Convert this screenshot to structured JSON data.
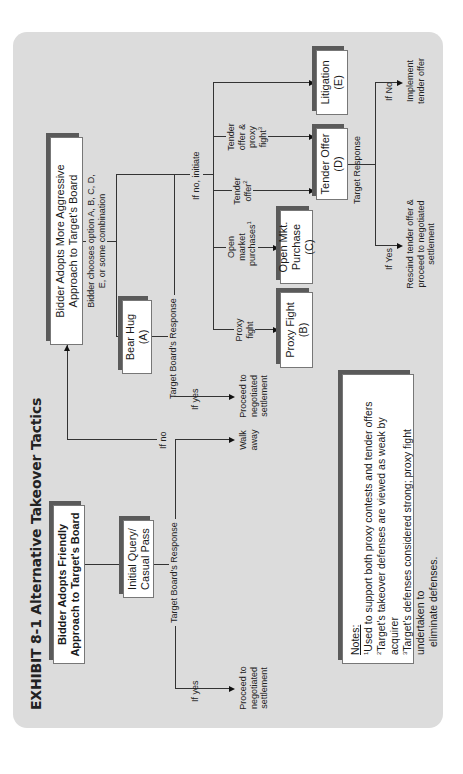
{
  "title": "EXHIBIT 8-1   Alternative Takeover Tactics",
  "boxes": {
    "friendly": "Bidder Adopts Friendly Approach to Target's Board",
    "initial_query": "Initial Query/ Casual Pass",
    "aggressive": "Bidder Adopts More Aggressive Approach to Target's Board",
    "bear_hug": "Bear Hug (A)",
    "proxy_fight": "Proxy Fight (B)",
    "open_market": "Open Mkt. Purchase  (C)",
    "tender_offer": "Tender Offer (D)",
    "litigation": "Litigation (E)"
  },
  "labels": {
    "target_boards_response_1": "Target Board's Response",
    "if_yes_1": "If yes",
    "proceed_1": "Proceed to negotiated settlement",
    "if_no_1": "If no",
    "walk_away": "Walk away",
    "bidder_chooses": "Bidder chooses option A, B, C, D, E, or some combination",
    "target_boards_response_2": "Target Board's Response",
    "if_yes_2": "If yes",
    "proceed_2": "Proceed to negotiated settlement",
    "if_no_initiate": "If no, initiate",
    "proxy_fight_branch": "Proxy fight",
    "open_market_branch": "Open market purchases",
    "open_market_sup": "1",
    "tender_offer_branch": "Tender offer",
    "tender_offer_sup": "2",
    "tender_proxy_branch": "Tender offer & proxy fight",
    "tender_proxy_sup": "3",
    "target_response": "Target Response",
    "if_yes_3": "If Yes",
    "rescind": "Rescind tender offer & proceed to negotiated settlement",
    "if_no_3": "If No",
    "implement": "Implement tender offer"
  },
  "notes": {
    "heading": "Notes:",
    "items": [
      {
        "sup": "1",
        "text": "Used to support both proxy contests and tender offers"
      },
      {
        "sup": "2",
        "text": "Target's takeover defenses are viewed as weak by acquirer"
      },
      {
        "sup": "3",
        "text": "Target's defenses considered strong; proxy fight undertaken to"
      },
      {
        "sup": "",
        "text": "eliminate defenses."
      }
    ]
  },
  "colors": {
    "panel": "#dcdcdc",
    "box_fill": "#ffffff",
    "box_shadow": "#5a5a5a",
    "line": "#333333"
  }
}
